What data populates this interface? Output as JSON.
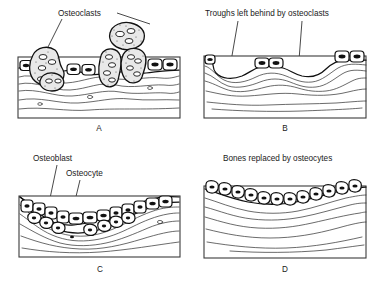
{
  "figure": {
    "title_present": false,
    "panel_count": 4,
    "background_color": "#ffffff",
    "ink_color": "#111111",
    "frame_color": "#3b3b3b"
  },
  "panels": [
    {
      "id": "A",
      "letter": "A",
      "labels": [
        {
          "text": "Osteoclasts",
          "name": "osteoclasts-label"
        }
      ],
      "leader_count": 2,
      "description": "Osteoclasts resorbing bone surface",
      "cells": {
        "osteoclast_count": 4,
        "lining_cell_count": 6
      }
    },
    {
      "id": "B",
      "letter": "B",
      "labels": [
        {
          "text": "Troughs left behind by osteoclasts",
          "name": "troughs-label"
        }
      ],
      "leader_count": 2,
      "description": "Resorption troughs in the bone surface",
      "cells": {
        "osteoclast_count": 0,
        "lining_cell_count": 5
      }
    },
    {
      "id": "C",
      "letter": "C",
      "labels": [
        {
          "text": "Osteoblast",
          "name": "osteoblast-label"
        },
        {
          "text": "Osteocyte",
          "name": "osteocyte-label"
        }
      ],
      "leader_count": 2,
      "description": "Osteoblasts filling the trough and osteocytes becoming embedded",
      "cells": {
        "osteoblast_count": 14,
        "osteocyte_count": 12
      }
    },
    {
      "id": "D",
      "letter": "D",
      "labels": [
        {
          "text": "Bones replaced by osteocytes",
          "name": "bones-replaced-label"
        }
      ],
      "leader_count": 0,
      "description": "Smooth restored bone surface lined by flattened cells",
      "cells": {
        "lining_cell_count": 11
      }
    }
  ]
}
